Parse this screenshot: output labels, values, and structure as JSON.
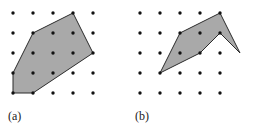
{
  "figure": {
    "background_color": "#ffffff",
    "width": 254,
    "height": 123,
    "dot_color": "#111111",
    "dot_radius": 1.7,
    "fill_color": "#a9a9a9",
    "stroke_color": "#2b2b2b",
    "stroke_width": 1
  },
  "grid": {
    "columns": 5,
    "rows": 5,
    "origin_x": 13,
    "origin_y": 13,
    "spacing_x": 20,
    "spacing_y": 20,
    "description": "5 by 5 array of lattice dots"
  },
  "panels": [
    {
      "id": "a",
      "caption": "(a)",
      "shape_name": "convex-polygon",
      "convex": true,
      "vertices_grid": [
        [
          1,
          1
        ],
        [
          3,
          0
        ],
        [
          4,
          2
        ],
        [
          1,
          4
        ],
        [
          0,
          4
        ],
        [
          0,
          3
        ]
      ],
      "vertices_px": [
        [
          33,
          33
        ],
        [
          73,
          13
        ],
        [
          93,
          53
        ],
        [
          33,
          93
        ],
        [
          13,
          93
        ],
        [
          13,
          73
        ]
      ]
    },
    {
      "id": "b",
      "caption": "(b)",
      "shape_name": "non-convex-chevron-polygon",
      "convex": false,
      "vertices_grid": [
        [
          1,
          3
        ],
        [
          2,
          1
        ],
        [
          4,
          0
        ],
        [
          5,
          2
        ],
        [
          4,
          1
        ],
        [
          3,
          2
        ]
      ],
      "vertices_px": [
        [
          33,
          73
        ],
        [
          53,
          33
        ],
        [
          93,
          13
        ],
        [
          113,
          53
        ],
        [
          93,
          33
        ],
        [
          73,
          53
        ]
      ]
    }
  ]
}
